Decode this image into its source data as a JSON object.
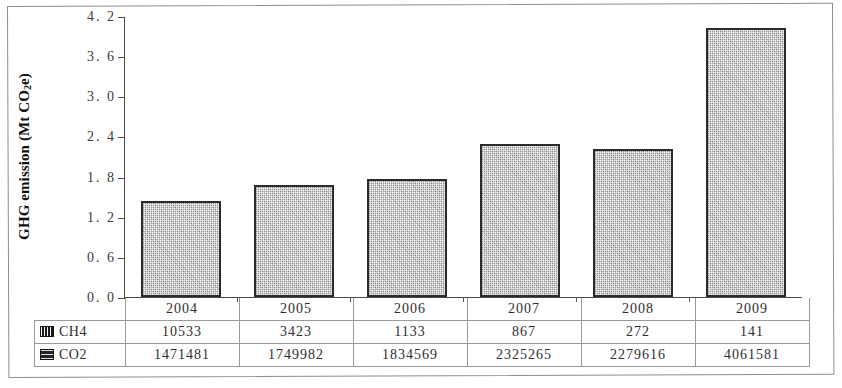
{
  "chart_data": {
    "type": "bar",
    "title": "",
    "xlabel": "",
    "ylabel": "GHG emission (Mt CO2e)",
    "categories": [
      "2004",
      "2005",
      "2006",
      "2007",
      "2008",
      "2009"
    ],
    "values": [
      1.43,
      1.68,
      1.76,
      2.28,
      2.21,
      4.02
    ],
    "ylim": [
      0.0,
      4.2
    ],
    "ytick_labels": [
      "4. 2",
      "3. 6",
      "3. 0",
      "2. 4",
      "1. 8",
      "1. 2",
      "0. 6",
      "0. 0"
    ],
    "ytick_values": [
      4.2,
      3.6,
      3.0,
      2.4,
      1.8,
      1.2,
      0.6,
      0.0
    ],
    "grid": false,
    "legend_position": "table-left",
    "series": [
      {
        "name": "CH4",
        "values": [
          10533,
          3423,
          1133,
          867,
          272,
          141
        ]
      },
      {
        "name": "CO2",
        "values": [
          1471481,
          1749982,
          1834569,
          2325265,
          2279616,
          4061581
        ]
      }
    ],
    "bar_color": "#bdbdbd",
    "bar_border_color": "#2b2b2b"
  },
  "axis": {
    "y_title_main": "GHG emission (Mt CO",
    "y_title_sub": "2",
    "y_title_tail": "e)",
    "ticks": [
      {
        "label": "4. 2",
        "value": 4.2
      },
      {
        "label": "3. 6",
        "value": 3.6
      },
      {
        "label": "3. 0",
        "value": 3.0
      },
      {
        "label": "2. 4",
        "value": 2.4
      },
      {
        "label": "1. 8",
        "value": 1.8
      },
      {
        "label": "1. 2",
        "value": 1.2
      },
      {
        "label": "0. 6",
        "value": 0.6
      },
      {
        "label": "0. 0",
        "value": 0.0
      }
    ]
  },
  "table": {
    "header": [
      "",
      "2004",
      "2005",
      "2006",
      "2007",
      "2008",
      "2009"
    ],
    "rows": [
      {
        "series": "CH4",
        "swatch": "ch4-legend-icon",
        "cells": [
          "10533",
          "3423",
          "1133",
          "867",
          "272",
          "141"
        ]
      },
      {
        "series": "CO2",
        "swatch": "co2-legend-icon",
        "cells": [
          "1471481",
          "1749982",
          "1834569",
          "2325265",
          "2279616",
          "4061581"
        ]
      }
    ]
  }
}
